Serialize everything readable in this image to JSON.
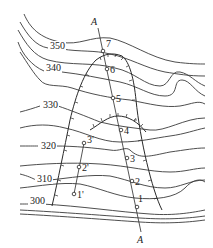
{
  "diagram": {
    "type": "topographic-contour-map",
    "contour_labels": [
      {
        "value": "350",
        "x": 50,
        "y": 49
      },
      {
        "value": "340",
        "x": 46,
        "y": 71
      },
      {
        "value": "330",
        "x": 43,
        "y": 108
      },
      {
        "value": "320",
        "x": 41,
        "y": 149
      },
      {
        "value": "310",
        "x": 37,
        "y": 182
      },
      {
        "value": "300",
        "x": 30,
        "y": 204
      }
    ],
    "profile_line": {
      "label_top": "A",
      "label_bottom": "A"
    },
    "points_main": [
      {
        "label": "7",
        "x": 103,
        "y": 51
      },
      {
        "label": "6",
        "x": 107,
        "y": 69
      },
      {
        "label": "5",
        "x": 113,
        "y": 98
      },
      {
        "label": "4",
        "x": 121,
        "y": 130
      },
      {
        "label": "3",
        "x": 127,
        "y": 158
      },
      {
        "label": "2",
        "x": 132,
        "y": 181
      },
      {
        "label": "1",
        "x": 137,
        "y": 207
      }
    ],
    "points_secondary": [
      {
        "label": "3'",
        "x": 84,
        "y": 143
      },
      {
        "label": "2'",
        "x": 79,
        "y": 167
      },
      {
        "label": "1'",
        "x": 74,
        "y": 194
      }
    ]
  }
}
